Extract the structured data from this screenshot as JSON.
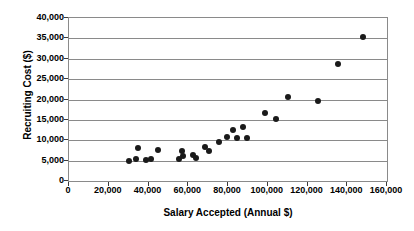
{
  "chart_data": {
    "type": "scatter",
    "title": "",
    "xlabel": "Salary Accepted (Annual $)",
    "ylabel": "Recruiting Cost ($)",
    "xlim": [
      0,
      160000
    ],
    "ylim": [
      0,
      40000
    ],
    "xticks": [
      0,
      20000,
      40000,
      60000,
      80000,
      100000,
      120000,
      140000,
      160000
    ],
    "yticks": [
      0,
      5000,
      10000,
      15000,
      20000,
      25000,
      30000,
      35000,
      40000
    ],
    "xtick_labels": [
      "0",
      "20,000",
      "40,000",
      "60,000",
      "80,000",
      "100,000",
      "120,000",
      "140,000",
      "160,000"
    ],
    "ytick_labels": [
      "0",
      "5,000",
      "10,000",
      "15,000",
      "20,000",
      "25,000",
      "30,000",
      "35,000",
      "40,000"
    ],
    "grid": "horizontal",
    "legend": null,
    "marker": {
      "shape": "circle",
      "color": "#1a1a1a",
      "size": 6
    },
    "series": [
      {
        "name": "Recruiting cost vs salary",
        "points": [
          {
            "x": 30000,
            "y": 4800
          },
          {
            "x": 33500,
            "y": 5400
          },
          {
            "x": 34500,
            "y": 8100
          },
          {
            "x": 38500,
            "y": 5200
          },
          {
            "x": 41500,
            "y": 5300
          },
          {
            "x": 45000,
            "y": 7700
          },
          {
            "x": 55500,
            "y": 5300
          },
          {
            "x": 57500,
            "y": 6200
          },
          {
            "x": 57000,
            "y": 7300
          },
          {
            "x": 62500,
            "y": 6400
          },
          {
            "x": 64000,
            "y": 5700
          },
          {
            "x": 68500,
            "y": 8400
          },
          {
            "x": 70500,
            "y": 7300
          },
          {
            "x": 75500,
            "y": 9600
          },
          {
            "x": 79500,
            "y": 10700
          },
          {
            "x": 82500,
            "y": 12400
          },
          {
            "x": 84500,
            "y": 10600
          },
          {
            "x": 87500,
            "y": 13200
          },
          {
            "x": 89500,
            "y": 10600
          },
          {
            "x": 98500,
            "y": 16600
          },
          {
            "x": 104000,
            "y": 15200
          },
          {
            "x": 110000,
            "y": 20500
          },
          {
            "x": 125500,
            "y": 19700
          },
          {
            "x": 135500,
            "y": 28600
          },
          {
            "x": 148000,
            "y": 35400
          }
        ]
      }
    ]
  }
}
